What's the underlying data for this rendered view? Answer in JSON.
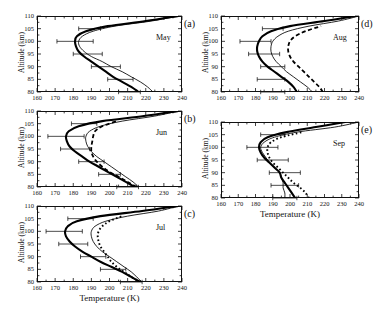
{
  "figure": {
    "axis_titles": {
      "x": "Temperature (K)",
      "y": "Altitude (km)"
    },
    "x_ticks": [
      "160",
      "170",
      "180",
      "190",
      "200",
      "210",
      "220",
      "230",
      "240"
    ],
    "y_ticks": [
      "80",
      "85",
      "90",
      "95",
      "100",
      "105",
      "110"
    ]
  },
  "panels": [
    {
      "letter": "(a)",
      "month": "May"
    },
    {
      "letter": "(b)",
      "month": "Jun"
    },
    {
      "letter": "(c)",
      "month": "Jul"
    },
    {
      "letter": "(d)",
      "month": "Aug"
    },
    {
      "letter": "(e)",
      "month": "Sep"
    }
  ],
  "chart_data": {
    "type": "line",
    "title": "",
    "xlabel": "Temperature (K)",
    "ylabel": "Altitude (km)",
    "xlim": [
      160,
      240
    ],
    "ylim": [
      80,
      110
    ],
    "xtick_step": 10,
    "ytick_step": 5,
    "grid": false,
    "legend": "none",
    "orientation": "temperature-on-x, altitude-on-y",
    "panels": [
      {
        "letter": "(a)",
        "month": "May",
        "series": [
          {
            "name": "thick-solid",
            "style": "thick solid",
            "altitude": [
              80,
              82,
              84,
              86,
              88,
              90,
              92,
              94,
              96,
              98,
              100,
              102,
              104,
              106,
              108,
              110
            ],
            "temperature": [
              216,
              212,
              207,
              202,
              198,
              194,
              190,
              186,
              183,
              181.5,
              181,
              182,
              187,
              199,
              220,
              238
            ]
          },
          {
            "name": "thin-solid",
            "style": "thin solid",
            "altitude": [
              80,
              82,
              84,
              86,
              88,
              90,
              92,
              94,
              96,
              98,
              100,
              102,
              104,
              106,
              108,
              110
            ],
            "temperature": [
              224,
              221,
              217,
              212,
              207,
              201,
              196,
              190,
              186,
              183.5,
              183,
              185,
              191,
              203,
              223,
              238
            ]
          }
        ],
        "errorbars": [
          {
            "altitude": 80,
            "temperature": 211,
            "xerr": 6
          },
          {
            "altitude": 85,
            "temperature": 206,
            "xerr": 7
          },
          {
            "altitude": 90,
            "temperature": 198,
            "xerr": 8
          },
          {
            "altitude": 95,
            "temperature": 188,
            "xerr": 8
          },
          {
            "altitude": 100,
            "temperature": 181,
            "xerr": 10
          },
          {
            "altitude": 105,
            "temperature": 189,
            "xerr": 6
          }
        ]
      },
      {
        "letter": "(b)",
        "month": "Jun",
        "series": [
          {
            "name": "thick-solid",
            "style": "thick solid",
            "altitude": [
              80,
              82,
              84,
              86,
              88,
              90,
              92,
              94,
              96,
              98,
              100,
              102,
              104,
              106,
              108,
              110
            ],
            "temperature": [
              214,
              209,
              204,
              199,
              194,
              189,
              185,
              181,
              178,
              176.5,
              176,
              177.5,
              183,
              196,
              219,
              238
            ]
          },
          {
            "name": "thin-solid",
            "style": "thin solid",
            "altitude": [
              80,
              82,
              84,
              86,
              88,
              90,
              92,
              94,
              96,
              98,
              100,
              102,
              104,
              106,
              108,
              110
            ],
            "temperature": [
              216,
              213,
              209,
              205,
              201,
              197,
              193,
              190,
              188,
              187,
              187,
              189,
              195,
              207,
              225,
              238
            ]
          },
          {
            "name": "dashed",
            "style": "dashed",
            "altitude": [
              80,
              82,
              84,
              86,
              88,
              90,
              92,
              94,
              96,
              98,
              100,
              102,
              104,
              106
            ],
            "temperature": [
              215,
              210,
              205,
              200,
              196,
              193,
              191,
              190,
              190,
              190.5,
              191,
              192,
              196,
              204
            ]
          }
        ],
        "errorbars": [
          {
            "altitude": 80,
            "temperature": 210,
            "xerr": 6
          },
          {
            "altitude": 85,
            "temperature": 200,
            "xerr": 6
          },
          {
            "altitude": 90,
            "temperature": 190,
            "xerr": 7
          },
          {
            "altitude": 95,
            "temperature": 181,
            "xerr": 8
          },
          {
            "altitude": 100,
            "temperature": 176,
            "xerr": 10
          },
          {
            "altitude": 105,
            "temperature": 186,
            "xerr": 7
          }
        ]
      },
      {
        "letter": "(c)",
        "month": "Jul",
        "series": [
          {
            "name": "thick-solid",
            "style": "thick solid",
            "altitude": [
              80,
              82,
              84,
              86,
              88,
              90,
              92,
              94,
              96,
              98,
              100,
              102,
              104,
              106,
              108,
              110
            ],
            "temperature": [
              217,
              212,
              207,
              201,
              195,
              190,
              185,
              181,
              178,
              176,
              175.5,
              177,
              182,
              195,
              218,
              238
            ]
          },
          {
            "name": "thin-solid",
            "style": "thin solid",
            "altitude": [
              80,
              82,
              84,
              86,
              88,
              90,
              92,
              94,
              96,
              98,
              100,
              102,
              104,
              106,
              108,
              110
            ],
            "temperature": [
              218,
              215,
              212,
              208,
              204,
              200,
              196,
              193,
              191,
              190,
              190,
              192,
              198,
              210,
              227,
              238
            ]
          },
          {
            "name": "dotted",
            "style": "dotted",
            "altitude": [
              80,
              82,
              84,
              86,
              88,
              90,
              92,
              94,
              96,
              98,
              100,
              102,
              104,
              106
            ],
            "temperature": [
              217,
              212,
              208,
              204,
              201,
              199,
              197,
              195,
              194,
              193.5,
              194,
              196,
              200,
              207
            ]
          }
        ],
        "errorbars": [
          {
            "altitude": 80,
            "temperature": 212,
            "xerr": 6
          },
          {
            "altitude": 85,
            "temperature": 202,
            "xerr": 7
          },
          {
            "altitude": 90,
            "temperature": 191,
            "xerr": 7
          },
          {
            "altitude": 95,
            "temperature": 180,
            "xerr": 8
          },
          {
            "altitude": 100,
            "temperature": 175,
            "xerr": 10
          },
          {
            "altitude": 105,
            "temperature": 184,
            "xerr": 7
          }
        ]
      },
      {
        "letter": "(d)",
        "month": "Aug",
        "series": [
          {
            "name": "thick-solid",
            "style": "thick solid",
            "altitude": [
              80,
              82,
              84,
              86,
              88,
              90,
              92,
              94,
              96,
              98,
              100,
              102,
              104,
              106,
              108,
              110
            ],
            "temperature": [
              204,
              202,
              199,
              195,
              191,
              187,
              184,
              182,
              181,
              181,
              182,
              184,
              189,
              200,
              220,
              238
            ]
          },
          {
            "name": "thin-solid",
            "style": "thin solid",
            "altitude": [
              80,
              82,
              84,
              86,
              88,
              90,
              92,
              94,
              96,
              98,
              100,
              102,
              104,
              106,
              108,
              110
            ],
            "temperature": [
              213,
              210,
              206,
              202,
              198,
              195,
              192,
              190,
              189,
              189,
              190,
              193,
              199,
              211,
              228,
              240
            ]
          },
          {
            "name": "dashed",
            "style": "dashed",
            "altitude": [
              80,
              82,
              84,
              86,
              88,
              90,
              92,
              94,
              96,
              98,
              100,
              102,
              104,
              106
            ],
            "temperature": [
              219,
              217,
              214,
              211,
              208,
              205,
              202,
              200,
              199,
              199,
              200,
              203,
              209,
              218
            ]
          }
        ],
        "errorbars": [
          {
            "altitude": 80,
            "temperature": 190,
            "xerr": 7
          },
          {
            "altitude": 85,
            "temperature": 189,
            "xerr": 8
          },
          {
            "altitude": 90,
            "temperature": 190,
            "xerr": 7
          },
          {
            "altitude": 95,
            "temperature": 185,
            "xerr": 9
          },
          {
            "altitude": 100,
            "temperature": 180,
            "xerr": 9
          },
          {
            "altitude": 105,
            "temperature": 190,
            "xerr": 6
          }
        ]
      },
      {
        "letter": "(e)",
        "month": "Sep",
        "series": [
          {
            "name": "thick-solid",
            "style": "thick solid",
            "altitude": [
              80,
              82,
              84,
              86,
              88,
              90,
              92,
              94,
              96,
              98,
              100,
              102,
              104,
              106,
              108,
              110
            ],
            "temperature": [
              203,
              201,
              199,
              197,
              195,
              194,
              191,
              188,
              185,
              183,
              182,
              183,
              187,
              198,
              215,
              232
            ]
          },
          {
            "name": "thin-solid",
            "style": "thin solid",
            "altitude": [
              80,
              82,
              84,
              86,
              88,
              90,
              92,
              94,
              96,
              98,
              100,
              102,
              104,
              106,
              108,
              110
            ],
            "temperature": [
              197,
              197,
              196,
              196,
              195,
              194,
              191,
              188,
              186,
              184,
              183,
              185,
              191,
              204,
              226,
              240
            ]
          },
          {
            "name": "dotted",
            "style": "dotted",
            "altitude": [
              80,
              82,
              84,
              86,
              88,
              90,
              92,
              94,
              96,
              98,
              100,
              102,
              104,
              106
            ],
            "temperature": [
              211,
              209,
              206,
              202,
              199,
              196,
              193,
              190,
              188,
              187,
              187,
              189,
              195,
              207
            ]
          }
        ],
        "errorbars": [
          {
            "altitude": 80,
            "temperature": 197,
            "xerr": 7
          },
          {
            "altitude": 85,
            "temperature": 197,
            "xerr": 8
          },
          {
            "altitude": 90,
            "temperature": 197,
            "xerr": 9
          },
          {
            "altitude": 95,
            "temperature": 190,
            "xerr": 9
          },
          {
            "altitude": 100,
            "temperature": 184,
            "xerr": 9
          },
          {
            "altitude": 105,
            "temperature": 190,
            "xerr": 7
          }
        ]
      }
    ]
  }
}
